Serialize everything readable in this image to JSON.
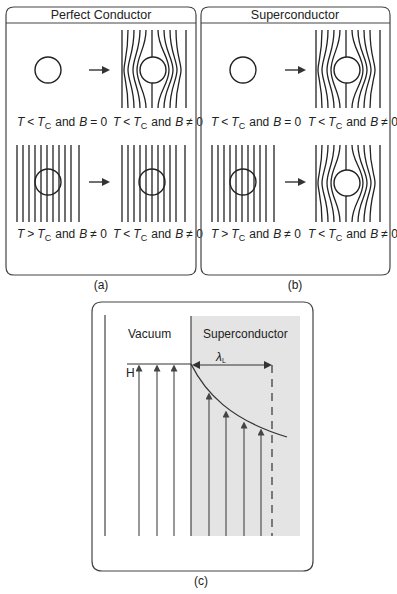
{
  "figure": {
    "panel_a": {
      "title": "Perfect Conductor",
      "caption": "(a)",
      "states": [
        {
          "T": "T",
          "rel": "<",
          "Tc": "T",
          "sub": "C",
          "cond": "and",
          "B": "B",
          "beq": "= 0"
        },
        {
          "T": "T",
          "rel": "<",
          "Tc": "T",
          "sub": "C",
          "cond": "and",
          "B": "B",
          "beq": "≠ 0"
        },
        {
          "T": "T",
          "rel": ">",
          "Tc": "T",
          "sub": "C",
          "cond": "and",
          "B": "B",
          "beq": "≠ 0"
        },
        {
          "T": "T",
          "rel": "<",
          "Tc": "T",
          "sub": "C",
          "cond": "and",
          "B": "B",
          "beq": "≠ 0"
        }
      ],
      "arrow_glyph": "→"
    },
    "panel_b": {
      "title": "Superconductor",
      "caption": "(b)",
      "states": [
        {
          "T": "T",
          "rel": "<",
          "Tc": "T",
          "sub": "C",
          "cond": "and",
          "B": "B",
          "beq": "= 0"
        },
        {
          "T": "T",
          "rel": "<",
          "Tc": "T",
          "sub": "C",
          "cond": "and",
          "B": "B",
          "beq": "≠ 0"
        },
        {
          "T": "T",
          "rel": ">",
          "Tc": "T",
          "sub": "C",
          "cond": "and",
          "B": "B",
          "beq": "≠ 0"
        },
        {
          "T": "T",
          "rel": "<",
          "Tc": "T",
          "sub": "C",
          "cond": "and",
          "B": "B",
          "beq": "≠ 0"
        }
      ],
      "arrow_glyph": "→"
    },
    "panel_c": {
      "caption": "(c)",
      "region_left": "Vacuum",
      "region_right": "Superconductor",
      "field_label": "H",
      "penetration_symbol": "λ",
      "penetration_sub": "L",
      "colors": {
        "superconductor_fill": "#e4e4e4",
        "line": "#444444"
      }
    }
  }
}
